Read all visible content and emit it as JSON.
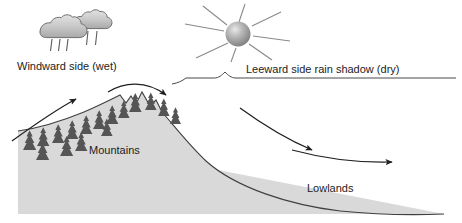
{
  "diagram": {
    "background_color": "#ffffff",
    "labels": {
      "windward": "Windward side (wet)",
      "leeward": "Leeward side rain shadow (dry)",
      "mountains": "Mountains",
      "lowlands": "Lowlands"
    },
    "icons": {
      "cloud": "rain-cloud-icon",
      "sun": "sun-icon",
      "trees": "conifer-tree-icon",
      "arrows": "airflow-arrow-icon",
      "brace": "span-brace-icon"
    },
    "colors": {
      "terrain_fill": "#d9d9d9",
      "terrain_stroke": "#3a3a3a",
      "tree": "#555555",
      "cloud_fill": "#bfbfbf",
      "cloud_stroke": "#6e6e6e",
      "sun_fill": "#9a9a9a",
      "ray_stroke": "#8a8a8a",
      "arrow": "#1f1f1f",
      "text": "#1c1c1c"
    },
    "counts": {
      "clouds": 2,
      "rain_streaks": 5,
      "sun_rays": 7,
      "airflow_arrows": 4,
      "trees": 16
    }
  }
}
